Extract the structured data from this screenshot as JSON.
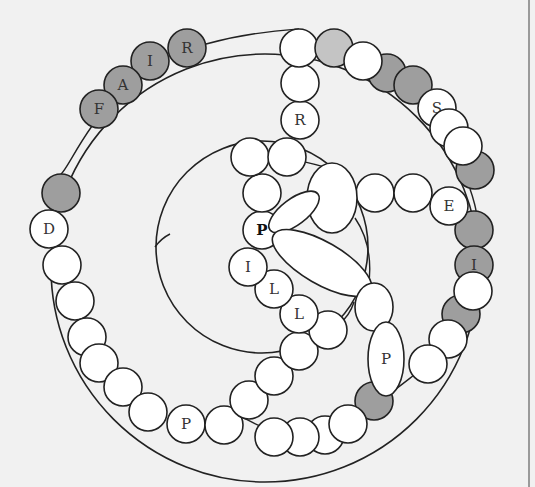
{
  "colors": {
    "background": "#f1f1f1",
    "stroke": "#222222",
    "white_bead": "#ffffff",
    "gray_bead": "#9e9e9e",
    "light_gray_bead": "#c4c4c4",
    "label": "#333333",
    "frame_line": "#9a9a9a"
  },
  "outer_arc": {
    "cx": 265,
    "cy": 268,
    "r": 214
  },
  "inner_circle": {
    "cx": 262,
    "cy": 247,
    "r": 106
  },
  "beads": [
    {
      "cx": 187,
      "cy": 48,
      "r": 19,
      "fill": "gray",
      "label": "R"
    },
    {
      "cx": 150,
      "cy": 61,
      "r": 19,
      "fill": "gray",
      "label": "I"
    },
    {
      "cx": 123,
      "cy": 85,
      "r": 19,
      "fill": "gray",
      "label": "A"
    },
    {
      "cx": 99,
      "cy": 109,
      "r": 19,
      "fill": "gray",
      "label": "F"
    },
    {
      "cx": 61,
      "cy": 193,
      "r": 19,
      "fill": "gray",
      "label": ""
    },
    {
      "cx": 49,
      "cy": 229,
      "r": 19,
      "fill": "white",
      "label": "D"
    },
    {
      "cx": 62,
      "cy": 265,
      "r": 19,
      "fill": "white",
      "label": ""
    },
    {
      "cx": 75,
      "cy": 301,
      "r": 19,
      "fill": "white",
      "label": ""
    },
    {
      "cx": 87,
      "cy": 337,
      "r": 19,
      "fill": "white",
      "label": ""
    },
    {
      "cx": 99,
      "cy": 363,
      "r": 19,
      "fill": "white",
      "label": ""
    },
    {
      "cx": 123,
      "cy": 387,
      "r": 19,
      "fill": "white",
      "label": ""
    },
    {
      "cx": 148,
      "cy": 412,
      "r": 19,
      "fill": "white",
      "label": ""
    },
    {
      "cx": 186,
      "cy": 424,
      "r": 19,
      "fill": "white",
      "label": "P"
    },
    {
      "cx": 224,
      "cy": 425,
      "r": 19,
      "fill": "white",
      "label": ""
    },
    {
      "cx": 249,
      "cy": 400,
      "r": 19,
      "fill": "white",
      "label": ""
    },
    {
      "cx": 274,
      "cy": 376,
      "r": 19,
      "fill": "white",
      "label": ""
    },
    {
      "cx": 299,
      "cy": 351,
      "r": 19,
      "fill": "white",
      "label": ""
    },
    {
      "cx": 328,
      "cy": 330,
      "r": 19,
      "fill": "white",
      "label": ""
    },
    {
      "cx": 299,
      "cy": 314,
      "r": 19,
      "fill": "white",
      "label": "L"
    },
    {
      "cx": 274,
      "cy": 289,
      "r": 19,
      "fill": "white",
      "label": "L"
    },
    {
      "cx": 248,
      "cy": 267,
      "r": 19,
      "fill": "white",
      "label": "I"
    },
    {
      "cx": 262,
      "cy": 230,
      "r": 19,
      "fill": "white",
      "label": "P",
      "bold": true
    },
    {
      "cx": 262,
      "cy": 193,
      "r": 19,
      "fill": "white",
      "label": ""
    },
    {
      "cx": 250,
      "cy": 157,
      "r": 19,
      "fill": "white",
      "label": ""
    },
    {
      "cx": 287,
      "cy": 157,
      "r": 19,
      "fill": "white",
      "label": ""
    },
    {
      "cx": 300,
      "cy": 120,
      "r": 19,
      "fill": "white",
      "label": "R"
    },
    {
      "cx": 300,
      "cy": 83,
      "r": 19,
      "fill": "white",
      "label": ""
    },
    {
      "cx": 299,
      "cy": 48,
      "r": 19,
      "fill": "white",
      "label": ""
    },
    {
      "cx": 334,
      "cy": 48,
      "r": 19,
      "fill": "light",
      "label": ""
    },
    {
      "cx": 387,
      "cy": 73,
      "r": 19,
      "fill": "gray",
      "label": ""
    },
    {
      "cx": 363,
      "cy": 61,
      "r": 19,
      "fill": "white",
      "label": ""
    },
    {
      "cx": 413,
      "cy": 85,
      "r": 19,
      "fill": "gray",
      "label": ""
    },
    {
      "cx": 437,
      "cy": 108,
      "r": 19,
      "fill": "white",
      "label": "S"
    },
    {
      "cx": 449,
      "cy": 128,
      "r": 19,
      "fill": "white",
      "label": ""
    },
    {
      "cx": 475,
      "cy": 170,
      "r": 19,
      "fill": "gray",
      "label": ""
    },
    {
      "cx": 463,
      "cy": 146,
      "r": 19,
      "fill": "white",
      "label": ""
    },
    {
      "cx": 375,
      "cy": 193,
      "r": 19,
      "fill": "white",
      "label": ""
    },
    {
      "cx": 413,
      "cy": 193,
      "r": 19,
      "fill": "white",
      "label": ""
    },
    {
      "cx": 474,
      "cy": 230,
      "r": 19,
      "fill": "gray",
      "label": ""
    },
    {
      "cx": 449,
      "cy": 206,
      "r": 19,
      "fill": "white",
      "label": "E"
    },
    {
      "cx": 474,
      "cy": 265,
      "r": 19,
      "fill": "gray",
      "label": "I"
    },
    {
      "cx": 461,
      "cy": 314,
      "r": 19,
      "fill": "gray",
      "label": ""
    },
    {
      "cx": 473,
      "cy": 291,
      "r": 19,
      "fill": "white",
      "label": ""
    },
    {
      "cx": 448,
      "cy": 339,
      "r": 19,
      "fill": "white",
      "label": ""
    },
    {
      "cx": 428,
      "cy": 364,
      "r": 19,
      "fill": "white",
      "label": ""
    },
    {
      "cx": 374,
      "cy": 401,
      "r": 19,
      "fill": "gray",
      "label": ""
    },
    {
      "cx": 325,
      "cy": 435,
      "r": 19,
      "fill": "white",
      "label": ""
    },
    {
      "cx": 300,
      "cy": 437,
      "r": 19,
      "fill": "white",
      "label": ""
    },
    {
      "cx": 274,
      "cy": 437,
      "r": 19,
      "fill": "white",
      "label": ""
    },
    {
      "cx": 348,
      "cy": 424,
      "r": 19,
      "fill": "white",
      "label": ""
    }
  ],
  "ellipses": [
    {
      "name": "large-oval",
      "cx": 332,
      "cy": 198,
      "rx": 25,
      "ry": 35,
      "rotate": 0,
      "label": ""
    },
    {
      "name": "small-tilted-oval",
      "cx": 294,
      "cy": 212,
      "rx": 30,
      "ry": 13,
      "rotate": -37,
      "label": ""
    },
    {
      "name": "long-tilted-oval",
      "cx": 322,
      "cy": 263,
      "rx": 56,
      "ry": 21,
      "rotate": 30,
      "label": ""
    },
    {
      "name": "upper-right-oval",
      "cx": 374,
      "cy": 307,
      "rx": 19,
      "ry": 24,
      "rotate": 0,
      "label": ""
    },
    {
      "name": "tall-p-oval",
      "cx": 386,
      "cy": 359,
      "rx": 18,
      "ry": 37,
      "rotate": 0,
      "label": "P"
    }
  ],
  "connectors": [
    {
      "d": "M 206 44 C 250 32 285 30 299 29"
    },
    {
      "d": "M 92 126 C 75 150 66 170 61 174"
    },
    {
      "d": "M 350 178 C 340 170 318 165 305 162"
    },
    {
      "d": "M 355 218 C 370 240 372 265 368 290"
    },
    {
      "d": "M 354 302 C 350 315 342 322 338 325"
    },
    {
      "d": "M 386 396 C 398 388 410 378 418 372"
    },
    {
      "d": "M 478 249 L 478 246"
    },
    {
      "d": "M 470 189 C 474 200 476 210 476 211"
    },
    {
      "d": "M 240 416 C 248 420 255 424 260 426"
    },
    {
      "d": "M 155 247 C 160 240 166 236 170 234"
    }
  ],
  "legend": {
    "word_outer": "FAIR",
    "word_inner": "PILL",
    "letters_right": "S E I P"
  }
}
